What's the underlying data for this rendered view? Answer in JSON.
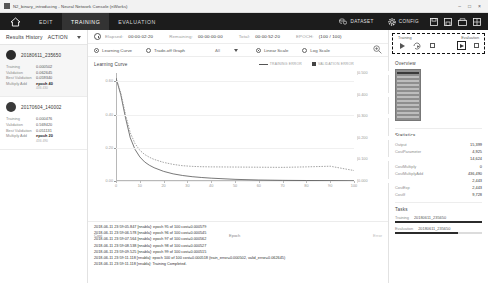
{
  "window": {
    "title": "N2_binary_introducing - Neural Network Console (nWorks)",
    "icon": "app-icon",
    "minimize": "–",
    "maximize": "□",
    "close": "×"
  },
  "nav": {
    "home_icon": "home-icon",
    "tabs": [
      {
        "label": "EDIT",
        "active": false
      },
      {
        "label": "TRAINING",
        "active": true
      },
      {
        "label": "EVALUATION",
        "active": false
      }
    ],
    "dataset": {
      "label": "DATASET",
      "icon": "dataset-icon"
    },
    "config": {
      "label": "CONFIG",
      "icon": "gear-icon"
    },
    "icons": [
      "save-icon",
      "save-as-icon",
      "export-icon",
      "grid-icon"
    ]
  },
  "sidebar": {
    "title": "Results History",
    "action_label": "ACTION",
    "caret": "chevron-down-icon",
    "cards": [
      {
        "id": "20180611_235650",
        "selected": true,
        "rows": [
          {
            "key": "Training",
            "value": "0.000502"
          },
          {
            "key": "Validation",
            "value": "0.062645"
          },
          {
            "key": "Best Validation",
            "value": "0.059340"
          },
          {
            "key": "Multiply Add",
            "value": "epoch 40",
            "bold": true
          }
        ],
        "sub": "436 430"
      },
      {
        "id": "20170604_140002",
        "selected": false,
        "rows": [
          {
            "key": "Training",
            "value": "0.000476"
          },
          {
            "key": "Validation",
            "value": "0.569420"
          },
          {
            "key": "Best Validation",
            "value": "0.051131"
          },
          {
            "key": "Multiply Add",
            "value": "epoch 20",
            "bold": true
          }
        ],
        "sub": "436 490"
      }
    ]
  },
  "status": {
    "clock_icon": "clock-icon",
    "items": [
      {
        "label": "Elapsed:",
        "value": "00:00:02:20"
      },
      {
        "label": "Remaining:",
        "value": "00:00:00:00"
      },
      {
        "label": "Total:",
        "value": "00:00:52:20"
      },
      {
        "label": "EPOCH:",
        "value": "(100 / 100)"
      }
    ]
  },
  "options": {
    "graph_type": [
      {
        "label": "Learning Curve",
        "selected": true
      },
      {
        "label": "Trade-off Graph",
        "selected": false
      }
    ],
    "filter_value": "All",
    "filter_caret": "chevron-down-icon",
    "scale": [
      {
        "label": "Linear Scale",
        "selected": true
      },
      {
        "label": "Log Scale",
        "selected": false
      }
    ],
    "zoom_icon": "zoom-in-icon"
  },
  "chart_data": {
    "type": "line",
    "title": "Learning Curve",
    "xlabel": "Epoch",
    "ylabel_left": "Cost",
    "ylabel_right": "Error",
    "xlim": [
      0,
      100
    ],
    "ylim_left": [
      0.0,
      0.65
    ],
    "ylim_right": [
      0.0,
      0.5
    ],
    "grid": true,
    "legend_position": "top-right",
    "xticks": [
      "0",
      "10",
      "20",
      "30",
      "40",
      "50",
      "60",
      "70",
      "80",
      "90",
      "100"
    ],
    "yticks_left": [
      "0.00",
      "0.20",
      "0.40",
      "0.60"
    ],
    "yticks_right": [
      "0.000",
      "0.100",
      "0.200",
      "0.300",
      "0.400",
      "0.500"
    ],
    "x": [
      0,
      2,
      4,
      6,
      8,
      10,
      12,
      14,
      16,
      20,
      24,
      28,
      32,
      36,
      40,
      50,
      60,
      70,
      80,
      90,
      100
    ],
    "series": [
      {
        "name": "TRAINING ERROR",
        "color": "#555555",
        "style": "solid",
        "values": [
          0.62,
          0.52,
          0.38,
          0.26,
          0.19,
          0.145,
          0.115,
          0.095,
          0.08,
          0.058,
          0.043,
          0.033,
          0.026,
          0.021,
          0.017,
          0.01,
          0.006,
          0.004,
          0.003,
          0.002,
          0.0005
        ]
      },
      {
        "name": "VALIDATION ERROR",
        "color": "#8c8c8c",
        "style": "dotted",
        "values": [
          0.62,
          0.53,
          0.4,
          0.29,
          0.225,
          0.185,
          0.16,
          0.143,
          0.13,
          0.112,
          0.1,
          0.092,
          0.088,
          0.086,
          0.085,
          0.084,
          0.083,
          0.082,
          0.085,
          0.089,
          0.063
        ]
      }
    ]
  },
  "log": {
    "lines": [
      "2018-06-11 23:59:05.847 [nnabla]: epoch 95 of 100 cost=0.000579",
      "2018-06-11 23:59:06.578 [nnabla]: epoch 96 of 100 cost=0.000545",
      "2018-06-11 23:59:07.564 [nnabla]: epoch 97 of 100 cost=0.000562",
      "2018-06-11 23:59:08.538 [nnabla]: epoch 98 of 100 cost=0.000527",
      "2018-06-11 23:59:09.525 [nnabla]: epoch 99 of 100 cost=0.000515",
      "2018-06-11 23:59:11.118 [nnabla]: epoch 100 of 100 cost=0.000518  (train_error=0.000502, valid_error=0.062645)",
      "2018-06-11 23:59:11.118 [nnabla]: Training Completed."
    ]
  },
  "controls": {
    "training_label": "Training",
    "evaluation_label": "Evaluation",
    "training_buttons": [
      "play-icon",
      "resume-play-icon",
      "stop-icon"
    ],
    "evaluation_buttons": [
      "play-icon",
      "stop-icon"
    ]
  },
  "overview": {
    "title": "Overview",
    "thumbnail": "network-diagram-thumbnail"
  },
  "statistics": {
    "title": "Statistics",
    "rows": [
      {
        "name": "Output",
        "value": "15,399"
      },
      {
        "name": "CostParameter",
        "value": "4,925"
      },
      {
        "name": "CostAdd",
        "value": "14,624"
      },
      {
        "name": "CostMultiply",
        "value": "0"
      },
      {
        "name": "CostMultiplyAdd",
        "value": "436,490"
      },
      {
        "name": "CostDivision",
        "value": "2,443"
      },
      {
        "name": "CostExp",
        "value": "2,443"
      },
      {
        "name": "CostIf",
        "value": "9,728"
      }
    ]
  },
  "tasks": {
    "title": "Tasks",
    "rows": [
      {
        "label": "Training",
        "id": "20180611_235650",
        "progress": 100
      },
      {
        "label": "Evaluation",
        "id": "20180611_235650",
        "progress": 72
      }
    ]
  }
}
